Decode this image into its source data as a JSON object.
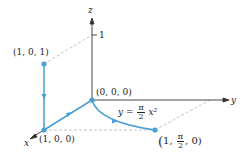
{
  "diagram": {
    "axes": {
      "z_label": "z",
      "y_label": "y",
      "x_label": "x",
      "z_tick_label": "1"
    },
    "points": {
      "p101": "(1, 0, 1)",
      "p000": "(0, 0, 0)",
      "p100": "(1, 0, 0)",
      "p1pi20_open": "(",
      "p1pi20_first": "1,",
      "p1pi20_num": "π",
      "p1pi20_den": "2",
      "p1pi20_last": ", 0)"
    },
    "curve_label": {
      "lhs": "y =",
      "num": "π",
      "den": "2",
      "rhs": "x²"
    },
    "colors": {
      "path": "#4a9fd4",
      "axis": "#333333",
      "dashed": "#bbbbbb"
    }
  }
}
